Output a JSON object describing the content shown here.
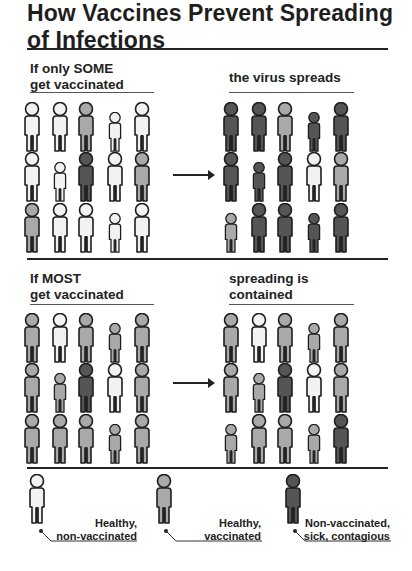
{
  "title": {
    "line1": "How Vaccines Prevent Spreading",
    "line2": "of Infections"
  },
  "colors": {
    "healthy_nonvacc": "#f2f2f2",
    "healthy_vacc": "#a9a9a9",
    "sick": "#555555",
    "outline": "#1e1e1e",
    "legs": "#222222"
  },
  "scenario_some": {
    "left_label_1": "If only SOME",
    "left_label_2": "get vaccinated",
    "right_label": "the virus spreads",
    "before": [
      [
        "W",
        "W",
        "G",
        "w",
        "W"
      ],
      [
        "W",
        "w",
        "D",
        "W",
        "G"
      ],
      [
        "G",
        "W",
        "W",
        "w",
        "W"
      ]
    ],
    "after": [
      [
        "D",
        "D",
        "G",
        "d",
        "D"
      ],
      [
        "D",
        "d",
        "D",
        "W",
        "G"
      ],
      [
        "g",
        "D",
        "D",
        "d",
        "D"
      ]
    ]
  },
  "scenario_most": {
    "left_label_1": "If MOST",
    "left_label_2": "get vaccinated",
    "right_label_1": "spreading is",
    "right_label_2": "contained",
    "before": [
      [
        "G",
        "W",
        "G",
        "g",
        "G"
      ],
      [
        "G",
        "g",
        "D",
        "W",
        "G"
      ],
      [
        "G",
        "G",
        "G",
        "g",
        "G"
      ]
    ],
    "after": [
      [
        "G",
        "W",
        "G",
        "g",
        "G"
      ],
      [
        "G",
        "g",
        "D",
        "W",
        "G"
      ],
      [
        "g",
        "G",
        "G",
        "g",
        "D"
      ]
    ]
  },
  "legend": [
    {
      "type": "W",
      "line1": "Healthy,",
      "line2": "non-vaccinated"
    },
    {
      "type": "G",
      "line1": "Healthy,",
      "line2": "vaccinated"
    },
    {
      "type": "D",
      "line1": "Non-vaccinated,",
      "line2": "sick, contagious"
    }
  ]
}
